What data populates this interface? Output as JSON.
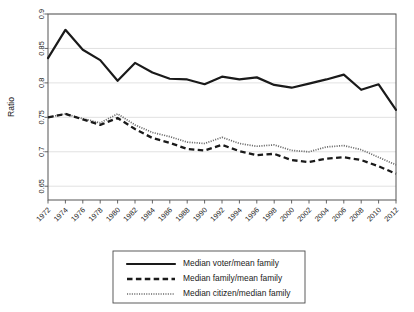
{
  "chart_data": {
    "type": "line",
    "title": "",
    "xlabel": "",
    "ylabel": "Ratio",
    "ylim": [
      0.63,
      0.9
    ],
    "xlim": [
      1972,
      2012
    ],
    "grid": true,
    "legend_position": "bottom",
    "yticks": [
      "0.65",
      "0.7",
      "0.75",
      "0.8",
      "0.85",
      "0.9"
    ],
    "ytick_values": [
      0.65,
      0.7,
      0.75,
      0.8,
      0.85,
      0.9
    ],
    "x": [
      1972,
      1974,
      1976,
      1978,
      1980,
      1982,
      1984,
      1986,
      1988,
      1990,
      1992,
      1994,
      1996,
      1998,
      2000,
      2002,
      2004,
      2006,
      2008,
      2010,
      2012
    ],
    "xtick_labels": [
      "1972",
      "1974",
      "1976",
      "1978",
      "1980",
      "1982",
      "1984",
      "1986",
      "1988",
      "1990",
      "1992",
      "1994",
      "1996",
      "1998",
      "2000",
      "2002",
      "2004",
      "2006",
      "2008",
      "2010",
      "2012"
    ],
    "series": [
      {
        "name": "Median voter/mean family",
        "style": "solid",
        "color": "#1a1a1a",
        "values": [
          0.836,
          0.877,
          0.848,
          0.833,
          0.803,
          0.829,
          0.815,
          0.806,
          0.805,
          0.798,
          0.809,
          0.805,
          0.808,
          0.797,
          0.793,
          0.799,
          0.805,
          0.812,
          0.79,
          0.798,
          0.761
        ]
      },
      {
        "name": "Median family/mean family",
        "style": "dashed",
        "color": "#1a1a1a",
        "values": [
          0.75,
          0.755,
          0.747,
          0.739,
          0.749,
          0.733,
          0.72,
          0.713,
          0.704,
          0.702,
          0.71,
          0.701,
          0.695,
          0.697,
          0.688,
          0.685,
          0.69,
          0.692,
          0.688,
          0.679,
          0.668
        ]
      },
      {
        "name": "Median citizen/median family",
        "style": "dotted",
        "color": "#6b6b6b",
        "values": [
          0.75,
          0.755,
          0.748,
          0.742,
          0.755,
          0.739,
          0.728,
          0.722,
          0.714,
          0.712,
          0.721,
          0.712,
          0.708,
          0.71,
          0.702,
          0.7,
          0.707,
          0.709,
          0.703,
          0.692,
          0.681
        ]
      }
    ]
  },
  "axis": {
    "ylabel": "Ratio"
  },
  "legend": {
    "items": [
      {
        "label": "Median voter/mean family",
        "style": "solid"
      },
      {
        "label": "Median family/mean family",
        "style": "dashed"
      },
      {
        "label": "Median citizen/median family",
        "style": "dotted"
      }
    ]
  }
}
